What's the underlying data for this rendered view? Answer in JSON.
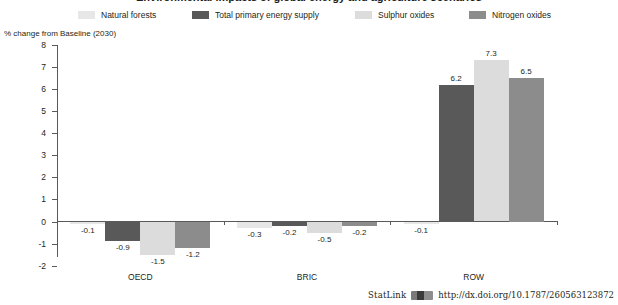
{
  "title_cropped": "Environmental impacts of global energy and agriculture scenarios",
  "axis_caption": "% change from Baseline (2030)",
  "legend": {
    "items": [
      {
        "label": "Natural forests",
        "color": "#e7e7e7"
      },
      {
        "label": "Total primary energy supply",
        "color": "#595959"
      },
      {
        "label": "Sulphur oxides",
        "color": "#dcdcdc"
      },
      {
        "label": "Nitrogen oxides",
        "color": "#8c8c8c"
      }
    ]
  },
  "footer": {
    "statlink_label": "StatLink",
    "statlink_icon": "statlink-barcode-icon",
    "url": "http://dx.doi.org/10.1787/260563123872"
  },
  "chart_data": {
    "type": "bar",
    "title": "",
    "xlabel": "",
    "ylabel": "% change from Baseline (2030)",
    "ylim": [
      -2,
      8
    ],
    "yticks": [
      -2,
      -1,
      0,
      1,
      2,
      3,
      4,
      5,
      6,
      7,
      8
    ],
    "ytick_labels": [
      "-2",
      "-1",
      "0",
      "1",
      "2",
      "3",
      "4",
      "5",
      "6",
      "7",
      "8"
    ],
    "grid": false,
    "legend_position": "top",
    "categories": [
      "OECD",
      "BRIC",
      "ROW"
    ],
    "series": [
      {
        "name": "Natural forests",
        "color": "#e7e7e7",
        "values": [
          -0.1,
          -0.3,
          -0.1
        ],
        "labels": [
          "-0.1",
          "-0.3",
          "-0.1"
        ]
      },
      {
        "name": "Total primary energy supply",
        "color": "#595959",
        "values": [
          -0.9,
          -0.2,
          6.2
        ],
        "labels": [
          "-0.9",
          "-0.2",
          "6.2"
        ]
      },
      {
        "name": "Sulphur oxides",
        "color": "#dcdcdc",
        "values": [
          -1.5,
          -0.5,
          7.3
        ],
        "labels": [
          "-1.5",
          "-0.5",
          "7.3"
        ]
      },
      {
        "name": "Nitrogen oxides",
        "color": "#8c8c8c",
        "values": [
          -1.2,
          -0.2,
          6.5
        ],
        "labels": [
          "-1.2",
          "-0.2",
          "6.5"
        ]
      }
    ]
  }
}
